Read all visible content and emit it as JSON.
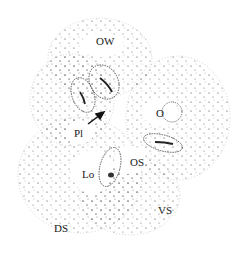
{
  "figure": {
    "labels": {
      "ow": "OW",
      "o": "O",
      "pl": "Pl",
      "os": "OS",
      "lo": "Lo",
      "vs": "VS",
      "ds": "DS"
    },
    "colors": {
      "background": "#ffffff",
      "stipple": "#3a3a3a",
      "outline": "#555555",
      "label": "#1a1a1a"
    }
  }
}
